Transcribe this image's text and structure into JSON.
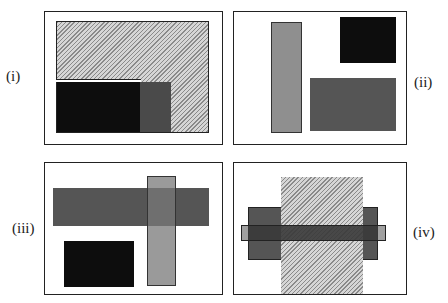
{
  "panels": [
    {
      "id": "i",
      "label": "(i)"
    },
    {
      "id": "ii",
      "label": "(ii)"
    },
    {
      "id": "iii",
      "label": "(iii)"
    },
    {
      "id": "iv",
      "label": "(iv)"
    }
  ],
  "colors": {
    "black": "#0d0d0d",
    "dark_gray": "#555555",
    "mid_gray": "#4a4a4a",
    "light_gray": "#8f8f8f",
    "hatch_light": "#d6d6d6",
    "hatch_dark": "#8a8a8a",
    "border": "#222222"
  }
}
